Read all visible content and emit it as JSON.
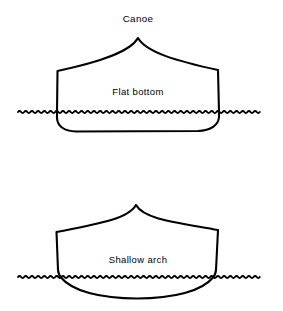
{
  "figure": {
    "title": "Canoe",
    "background_color": "#ffffff",
    "line_color": "#000000",
    "width": 283,
    "height": 311
  },
  "diagrams": [
    {
      "id": "flat-bottom",
      "label": "Canoe",
      "hull_label": "Flat bottom",
      "hull_type": "flat bottom",
      "label_x": 138,
      "label_y": 95,
      "title_x": 138,
      "title_y": 22,
      "waterline": {
        "y": 112,
        "x_start": 18,
        "x_end": 262,
        "amplitude": 2.1,
        "period": 6.2
      },
      "geometry": {
        "peak_x": 138,
        "peak_y": 38,
        "left_shoulder_x": 57,
        "left_shoulder_y": 71,
        "right_shoulder_x": 218,
        "right_shoulder_y": 70,
        "bottom_y": 131,
        "left_side_bottom_x": 57,
        "right_side_bottom_x": 219
      }
    },
    {
      "id": "shallow-arch",
      "label": "",
      "hull_label": "Shallow arch",
      "hull_type": "shallow arch",
      "label_x": 138,
      "label_y": 263,
      "waterline": {
        "y": 277,
        "x_start": 18,
        "x_end": 262,
        "amplitude": 2.1,
        "period": 6.2
      },
      "geometry": {
        "peak_x": 136,
        "peak_y": 205,
        "left_shoulder_x": 56,
        "left_shoulder_y": 232,
        "right_shoulder_x": 218,
        "right_shoulder_y": 230,
        "bottom_y": 298,
        "left_side_bottom_x": 61,
        "right_side_bottom_x": 213
      }
    }
  ]
}
